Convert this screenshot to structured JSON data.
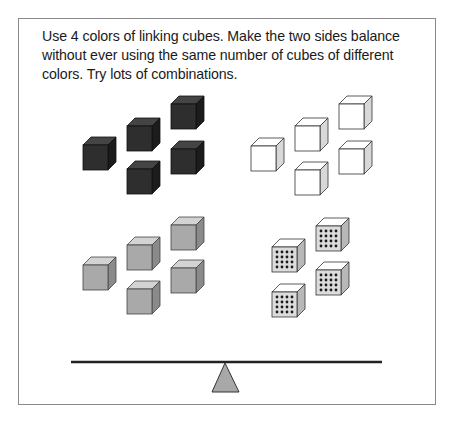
{
  "instructions": {
    "text": "Use 4 colors of linking cubes. Make the two sides balance without ever using the same number of cubes of different colors. Try lots of combinations."
  },
  "colors": {
    "dark": {
      "front": "#2e2e2e",
      "top": "#444444",
      "side": "#1c1c1c",
      "stroke": "#111111"
    },
    "white": {
      "front": "#ffffff",
      "top": "#ffffff",
      "side": "#d8d8d8",
      "stroke": "#333333"
    },
    "grey": {
      "front": "#a9a9a9",
      "top": "#d3d3d3",
      "side": "#8a8a8a",
      "stroke": "#444444"
    },
    "dotted": {
      "front": "#dcdcdc",
      "top": "#ffffff",
      "side": "#b8b8b8",
      "stroke": "#333333",
      "dot": "#1a1a1a"
    }
  },
  "cube_groups": [
    {
      "name": "dark-cubes",
      "color": "dark",
      "count": 5,
      "positions": [
        [
          83,
          145
        ],
        [
          127,
          126
        ],
        [
          171,
          104
        ],
        [
          171,
          149
        ],
        [
          127,
          169
        ]
      ]
    },
    {
      "name": "white-cubes",
      "color": "white",
      "count": 5,
      "positions": [
        [
          251,
          146
        ],
        [
          295,
          126
        ],
        [
          339,
          104
        ],
        [
          339,
          149
        ],
        [
          295,
          170
        ]
      ]
    },
    {
      "name": "grey-cubes",
      "color": "grey",
      "count": 5,
      "positions": [
        [
          83,
          265
        ],
        [
          127,
          245
        ],
        [
          171,
          225
        ],
        [
          171,
          268
        ],
        [
          127,
          289
        ]
      ]
    },
    {
      "name": "dotted-cubes",
      "color": "dotted",
      "count": 4,
      "positions": [
        [
          272,
          247
        ],
        [
          316,
          226
        ],
        [
          316,
          270
        ],
        [
          272,
          292
        ]
      ]
    }
  ],
  "balance": {
    "beam": {
      "x1": 71,
      "x2": 382,
      "y": 362,
      "color": "#222222"
    },
    "fulcrum": {
      "apex": [
        225,
        363
      ],
      "base_left": [
        212,
        392
      ],
      "base_right": [
        239,
        392
      ],
      "fill": "#a8a8a8",
      "stroke": "#333333"
    }
  }
}
